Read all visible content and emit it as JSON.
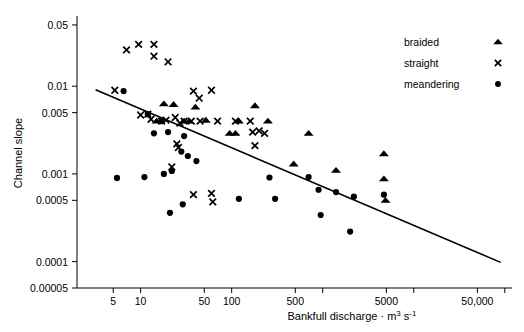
{
  "chart_data": {
    "type": "scatter",
    "title": "",
    "xlabel": "Bankfull discharge · m3 s-1",
    "xlabel_parts": {
      "base": "Bankfull discharge",
      "separator": "·",
      "unit_m": "m",
      "unit_m_exp": "3",
      "unit_s": "s",
      "unit_s_exp": "-1"
    },
    "ylabel": "Channel slope",
    "xscale": "log",
    "yscale": "log",
    "xlim": [
      2,
      120000
    ],
    "ylim": [
      5e-05,
      0.06
    ],
    "grid": false,
    "xticklabels": [
      "5",
      "10",
      "50",
      "100",
      "500",
      "5000",
      "50,000"
    ],
    "xtickvalues": [
      5,
      10,
      50,
      100,
      500,
      5000,
      50000
    ],
    "xminorticks": [
      5,
      10,
      50,
      100,
      500,
      1000,
      5000,
      10000,
      50000,
      100000
    ],
    "yticklabels": [
      "0.05",
      "0.01",
      "0.005",
      "0.001",
      "0.0005",
      "0.0001",
      "0.00005"
    ],
    "ytickvalues": [
      0.05,
      0.01,
      0.005,
      0.001,
      0.0005,
      0.0001,
      5e-05
    ],
    "legend_position": "top-right",
    "legend": [
      {
        "name": "braided",
        "marker": "triangle"
      },
      {
        "name": "straight",
        "marker": "cross"
      },
      {
        "name": "meandering",
        "marker": "circle"
      }
    ],
    "trendline": {
      "label": "regression line",
      "x": [
        3.2,
        90000
      ],
      "y": [
        0.0091,
        9.8e-05
      ]
    },
    "series": [
      {
        "name": "braided",
        "marker": "triangle",
        "points": [
          [
            18,
            0.0063
          ],
          [
            23,
            0.0062
          ],
          [
            40,
            0.0058
          ],
          [
            15,
            0.004
          ],
          [
            30,
            0.004
          ],
          [
            34,
            0.004
          ],
          [
            52,
            0.0041
          ],
          [
            120,
            0.004
          ],
          [
            180,
            0.006
          ],
          [
            250,
            0.004
          ],
          [
            95,
            0.0029
          ],
          [
            110,
            0.0029
          ],
          [
            700,
            0.0029
          ],
          [
            480,
            0.0013
          ],
          [
            1400,
            0.0011
          ],
          [
            4700,
            0.0017
          ],
          [
            4700,
            0.00088
          ],
          [
            4900,
            0.0005
          ]
        ]
      },
      {
        "name": "straight",
        "marker": "cross",
        "points": [
          [
            7,
            0.026
          ],
          [
            9.5,
            0.03
          ],
          [
            14,
            0.03
          ],
          [
            14,
            0.022
          ],
          [
            20,
            0.019
          ],
          [
            5.2,
            0.009
          ],
          [
            38,
            0.0088
          ],
          [
            60,
            0.009
          ],
          [
            44,
            0.0073
          ],
          [
            12,
            0.0048
          ],
          [
            13,
            0.0042
          ],
          [
            17,
            0.004
          ],
          [
            19,
            0.0041
          ],
          [
            24,
            0.0044
          ],
          [
            27,
            0.0038
          ],
          [
            30,
            0.004
          ],
          [
            36,
            0.004
          ],
          [
            45,
            0.004
          ],
          [
            70,
            0.004
          ],
          [
            110,
            0.004
          ],
          [
            160,
            0.004
          ],
          [
            170,
            0.003
          ],
          [
            200,
            0.0031
          ],
          [
            230,
            0.0029
          ],
          [
            25,
            0.0022
          ],
          [
            26,
            0.002
          ],
          [
            22,
            0.0012
          ],
          [
            38,
            0.00058
          ],
          [
            60,
            0.0006
          ],
          [
            62,
            0.00048
          ],
          [
            10,
            0.0047
          ],
          [
            180,
            0.0021
          ]
        ]
      },
      {
        "name": "meandering",
        "marker": "circle",
        "points": [
          [
            6.5,
            0.0088
          ],
          [
            12,
            0.0048
          ],
          [
            17,
            0.004
          ],
          [
            14,
            0.0029
          ],
          [
            20,
            0.003
          ],
          [
            30,
            0.0027
          ],
          [
            28,
            0.0018
          ],
          [
            33,
            0.0016
          ],
          [
            41,
            0.0014
          ],
          [
            5.5,
            0.0009
          ],
          [
            11,
            0.00092
          ],
          [
            18,
            0.001
          ],
          [
            22,
            0.00108
          ],
          [
            21,
            0.00036
          ],
          [
            29,
            0.00045
          ],
          [
            120,
            0.00052
          ],
          [
            300,
            0.00052
          ],
          [
            260,
            0.00091
          ],
          [
            700,
            0.00092
          ],
          [
            900,
            0.00066
          ],
          [
            1400,
            0.00062
          ],
          [
            2200,
            0.00055
          ],
          [
            950,
            0.00034
          ],
          [
            4700,
            0.00058
          ],
          [
            2000,
            0.00022
          ]
        ]
      }
    ]
  }
}
